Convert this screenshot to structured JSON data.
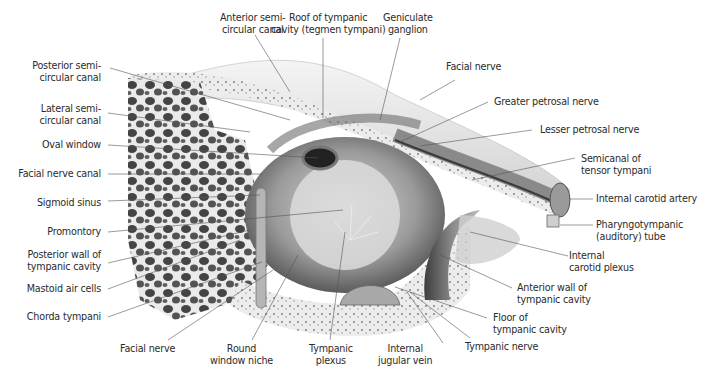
{
  "figure": {
    "labels": {
      "anterior_semicircular_canal": [
        "Anterior semi-",
        "circular canal"
      ],
      "roof_of_tympanic_cavity": [
        "Roof of tympanic",
        "cavity (tegmen tympani)"
      ],
      "geniculate_ganglion": [
        "Geniculate",
        "ganglion"
      ],
      "facial_nerve_top": [
        "Facial nerve"
      ],
      "greater_petrosal_nerve": [
        "Greater petrosal nerve"
      ],
      "lesser_petrosal_nerve": [
        "Lesser petrosal nerve"
      ],
      "semicanal_tensor_tympani": [
        "Semicanal of",
        "tensor tympani"
      ],
      "internal_carotid_artery": [
        "Internal carotid artery"
      ],
      "pharyngotympanic_tube": [
        "Pharyngotympanic",
        "(auditory) tube"
      ],
      "internal_carotid_plexus": [
        "Internal",
        "carotid plexus"
      ],
      "anterior_wall": [
        "Anterior wall of",
        "tympanic cavity"
      ],
      "floor_of_tympanic_cavity": [
        "Floor of",
        "tympanic cavity"
      ],
      "tympanic_nerve": [
        "Tympanic nerve"
      ],
      "internal_jugular_vein": [
        "Internal",
        "jugular vein"
      ],
      "tympanic_plexus": [
        "Tympanic",
        "plexus"
      ],
      "round_window_niche": [
        "Round",
        "window niche"
      ],
      "facial_nerve_bottom": [
        "Facial nerve"
      ],
      "chorda_tympani": [
        "Chorda tympani"
      ],
      "mastoid_air_cells": [
        "Mastoid air cells"
      ],
      "posterior_wall": [
        "Posterior wall of",
        "tympanic cavity"
      ],
      "promontory": [
        "Promontory"
      ],
      "sigmoid_sinus": [
        "Sigmoid sinus"
      ],
      "facial_nerve_canal": [
        "Facial nerve canal"
      ],
      "oval_window": [
        "Oval window"
      ],
      "lateral_semicircular_canal": [
        "Lateral semi-",
        "circular canal"
      ],
      "posterior_semicircular_canal": [
        "Posterior semi-",
        "circular canal"
      ]
    },
    "colors": {
      "text": "#2b2b2b",
      "leader_line": "#555555",
      "bone_light": "#e4e4e4",
      "bone_dark": "#3a3a3a",
      "background": "#ffffff"
    }
  }
}
